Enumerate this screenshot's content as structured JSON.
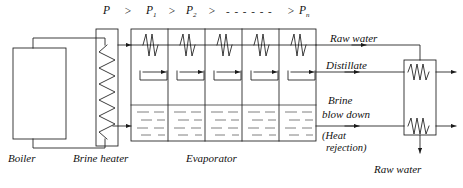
{
  "diagram": {
    "type": "process-flow-diagram",
    "stroke_color": "#1a1a1a",
    "background_color": "#ffffff",
    "pressure_labels": {
      "p0": "P",
      "gt1": ">",
      "p1_base": "P",
      "p1_sub": "1",
      "gt2": ">",
      "p2_base": "P",
      "p2_sub": "2",
      "gt3": ">",
      "dashes": "- - - - - -",
      "gt4": ">",
      "pn_base": "P",
      "pn_sub": "n"
    },
    "component_labels": {
      "boiler": "Boiler",
      "brine_heater": "Brine heater",
      "evaporator": "Evaporator"
    },
    "stream_labels": {
      "raw_water_top": "Raw water",
      "distillate": "Distillate",
      "brine_line1": "Brine",
      "brine_line2": "blow down",
      "heat_rejection_line1": "(Heat",
      "heat_rejection_line2": "rejection)",
      "raw_water_bottom": "Raw water"
    },
    "stages": {
      "count": 5,
      "features": [
        "condenser-coil",
        "distillate-tray",
        "brine-pool"
      ]
    }
  }
}
